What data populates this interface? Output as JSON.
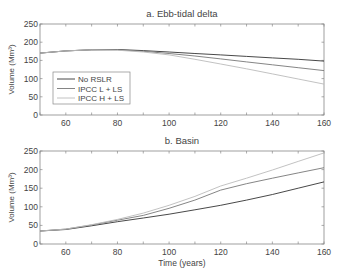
{
  "chart_data": [
    {
      "type": "line",
      "title": "a. Ebb-tidal delta",
      "xlabel": "",
      "ylabel": "Volume (Mm³)",
      "xlim": [
        50,
        160
      ],
      "ylim": [
        0,
        250
      ],
      "xticks": [
        60,
        80,
        100,
        120,
        140,
        160
      ],
      "yticks": [
        0,
        50,
        100,
        150,
        200,
        250
      ],
      "grid": false,
      "legend_position": "lower left",
      "x": [
        50,
        60,
        70,
        80,
        90,
        100,
        110,
        120,
        130,
        140,
        150,
        160
      ],
      "series": [
        {
          "name": "No RSLR",
          "color": "#333333",
          "values": [
            170,
            176,
            179,
            180,
            177,
            173,
            169,
            165,
            161,
            157,
            153,
            148
          ]
        },
        {
          "name": "IPCC L + LS",
          "color": "#777777",
          "values": [
            170,
            176,
            179,
            179,
            175,
            169,
            162,
            154,
            146,
            138,
            130,
            122
          ]
        },
        {
          "name": "IPCC H + LS",
          "color": "#bbbbbb",
          "values": [
            170,
            176,
            179,
            178,
            173,
            165,
            153,
            140,
            127,
            113,
            99,
            85
          ]
        }
      ]
    },
    {
      "type": "line",
      "title": "b. Basin",
      "xlabel": "Time (years)",
      "ylabel": "Volume (Mm³)",
      "xlim": [
        50,
        160
      ],
      "ylim": [
        0,
        250
      ],
      "xticks": [
        60,
        80,
        100,
        120,
        140,
        160
      ],
      "yticks": [
        0,
        50,
        100,
        150,
        200,
        250
      ],
      "grid": false,
      "x": [
        50,
        60,
        70,
        80,
        90,
        100,
        110,
        120,
        130,
        140,
        150,
        160
      ],
      "series": [
        {
          "name": "No RSLR",
          "color": "#333333",
          "values": [
            35,
            39,
            49,
            60,
            70,
            80,
            92,
            104,
            118,
            133,
            150,
            167
          ]
        },
        {
          "name": "IPCC L + LS",
          "color": "#777777",
          "values": [
            35,
            40,
            51,
            64,
            77,
            96,
            118,
            145,
            162,
            177,
            191,
            205
          ]
        },
        {
          "name": "IPCC H + LS",
          "color": "#bbbbbb",
          "values": [
            35,
            40,
            52,
            66,
            83,
            104,
            128,
            156,
            177,
            199,
            222,
            245
          ]
        }
      ]
    }
  ]
}
